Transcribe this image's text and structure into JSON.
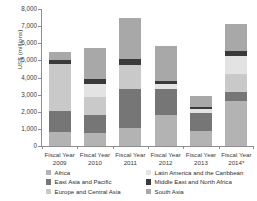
{
  "chart_data": {
    "type": "bar",
    "stacked": true,
    "title": "",
    "subtitle": "",
    "xlabel": "",
    "ylabel": "US$ (millions)",
    "ylim": [
      0,
      8000
    ],
    "ytick_labels": [
      "8,000",
      "7,000",
      "6,000",
      "5,000",
      "4,000",
      "3,000",
      "2,000",
      "1,000",
      "0"
    ],
    "ytick_values": [
      8000,
      7000,
      6000,
      5000,
      4000,
      3000,
      2000,
      1000,
      0
    ],
    "grid": false,
    "legend_position": "bottom",
    "categories": [
      "Fiscal Year 2009",
      "Fiscal Year 2010",
      "Fiscal Year 2011",
      "Fiscal Year 2012",
      "Fiscal Year 2013",
      "Fiscal Year 2014*"
    ],
    "category_lines": [
      {
        "line1": "Fiscal Year",
        "line2": "2009"
      },
      {
        "line1": "Fiscal Year",
        "line2": "2010"
      },
      {
        "line1": "Fiscal Year",
        "line2": "2011"
      },
      {
        "line1": "Fiscal Year",
        "line2": "2012"
      },
      {
        "line1": "Fiscal Year",
        "line2": "2013"
      },
      {
        "line1": "Fiscal Year",
        "line2": "2014*"
      }
    ],
    "series": [
      {
        "name": "Africa",
        "color": "#b3b3b3",
        "values": [
          800,
          750,
          1050,
          1800,
          900,
          2600
        ]
      },
      {
        "name": "East Asia and Pacific",
        "color": "#767676",
        "values": [
          1250,
          1050,
          2300,
          1550,
          1050,
          550
        ]
      },
      {
        "name": "Europe and Central Asia",
        "color": "#c9c9c9",
        "values": [
          2750,
          1050,
          1400,
          0,
          0,
          1050
        ]
      },
      {
        "name": "Latin America and the Caribbean",
        "color": "#e3e3e3",
        "values": [
          0,
          750,
          0,
          300,
          200,
          1050
        ]
      },
      {
        "name": "Middle East and North Africa",
        "color": "#3a3a3a",
        "values": [
          200,
          300,
          350,
          150,
          130,
          300
        ]
      },
      {
        "name": "South Asia",
        "color": "#a8a8a8",
        "values": [
          500,
          1850,
          2400,
          2050,
          620,
          1550
        ]
      }
    ],
    "totals": [
      5500,
      5750,
      7500,
      5850,
      2900,
      7100
    ],
    "legend_entries": [
      {
        "label": "Africa",
        "color": "#b3b3b3"
      },
      {
        "label": "East Asia and Pacific",
        "color": "#767676"
      },
      {
        "label": "Europe and Central Asia",
        "color": "#c9c9c9"
      },
      {
        "label": "Latin America and the Caribbean",
        "color": "#e3e3e3"
      },
      {
        "label": "Middle East and North Africa",
        "color": "#3a3a3a"
      },
      {
        "label": "South Asia",
        "color": "#a8a8a8"
      }
    ]
  }
}
